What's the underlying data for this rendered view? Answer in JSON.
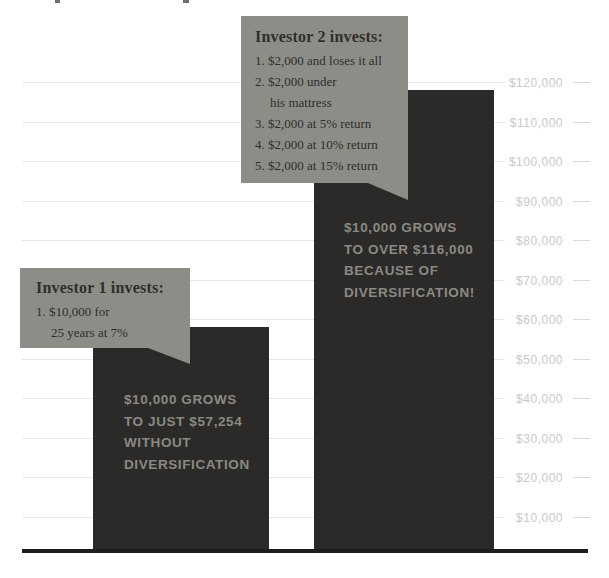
{
  "chart_data": {
    "type": "bar",
    "title": "",
    "categories": [
      "Investor 1 (without diversification)",
      "Investor 2 (with diversification)"
    ],
    "values": [
      57254,
      116000
    ],
    "xlabel": "",
    "ylabel": "",
    "ylim": [
      0,
      125000
    ],
    "grid": true,
    "legend": "none",
    "ytick_labels": [
      "$120,000",
      "$110,000",
      "$100,000",
      "$90,000",
      "$80,000",
      "$70,000",
      "$60,000",
      "$50,000",
      "$40,000",
      "$30,000",
      "$20,000",
      "$10,000"
    ],
    "ytick_values": [
      120000,
      110000,
      100000,
      90000,
      80000,
      70000,
      60000,
      50000,
      40000,
      30000,
      20000,
      10000
    ],
    "bar_annotations": [
      "$10,000 GROWS\nTO JUST $57,254\nWITHOUT\nDIVERSIFICATION",
      "$10,000 GROWS\nTO OVER $116,000\nBECAUSE OF\nDIVERSIFICATION!"
    ]
  },
  "callouts": {
    "investor1": {
      "title": "Investor 1 invests:",
      "items": [
        "1. $10,000 for\n25 years at 7%"
      ]
    },
    "investor2": {
      "title": "Investor 2 invests:",
      "items": [
        "1. $2,000 and loses it all",
        "2. $2,000 under\nhis mattress",
        "3. $2,000 at 5% return",
        "4. $2,000 at 10% return",
        "5. $2,000 at 15% return"
      ]
    }
  },
  "colors": {
    "bar": "#2b2a28",
    "callout_bg": "#8d8d87",
    "callout_text": "#2f2e2c",
    "bar_text": "#8a8984",
    "tick_label": "#c9c9c7",
    "gridline": "#e7e7e5",
    "axis_line": "#1d1d1d",
    "background": "#ffffff"
  }
}
